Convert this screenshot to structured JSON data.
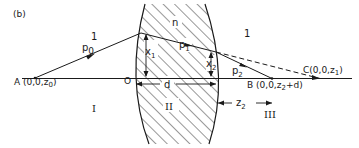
{
  "figure": {
    "panel_label": "(b)",
    "colors": {
      "ink": "#1a1a1a",
      "background": "#ffffff"
    },
    "regions": {
      "region_1_label": "I",
      "region_2_label": "II",
      "region_3_label": "III"
    },
    "media": {
      "left_index": "1",
      "right_index": "1",
      "lens_index": "n"
    },
    "points": {
      "A": "A (0,0,z",
      "A_sub": "0",
      "A_close": ")",
      "O": "O",
      "B": "B (0,0,z",
      "B_sub": "2",
      "B_close": "+d)",
      "C": "C(0,0,z",
      "C_sub": "1",
      "C_close": ")"
    },
    "rays": {
      "p0": "p",
      "p0_sub": "0",
      "p1": "p",
      "p1_sub": "1",
      "p2": "p",
      "p2_sub": "2"
    },
    "heights": {
      "x1": "x",
      "x1_sub": "1",
      "x2": "x",
      "x2_sub": "2"
    },
    "distances": {
      "d": "d",
      "z2": "z",
      "z2_sub": "2"
    }
  }
}
